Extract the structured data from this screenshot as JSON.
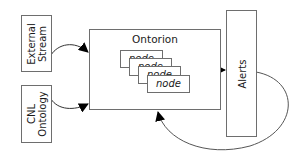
{
  "diagram": {
    "inputs": [
      {
        "id": "external-stream",
        "lines": [
          "External",
          "Stream"
        ]
      },
      {
        "id": "cnl-ontology",
        "lines": [
          "CNL",
          "Ontology"
        ]
      }
    ],
    "processor": {
      "title": "Ontorion",
      "nodes": [
        "node",
        "node",
        "node",
        "node"
      ]
    },
    "output": {
      "label": "Alerts"
    },
    "edges": [
      {
        "from": "External Stream",
        "to": "Ontorion"
      },
      {
        "from": "CNL Ontology",
        "to": "Ontorion"
      },
      {
        "from": "Ontorion",
        "to": "Alerts"
      },
      {
        "from": "Alerts",
        "to": "Ontorion",
        "style": "feedback loop"
      }
    ],
    "colors": {
      "border": "#6e6e6e",
      "arrow": "#000000",
      "text": "#1a1a1a"
    }
  }
}
